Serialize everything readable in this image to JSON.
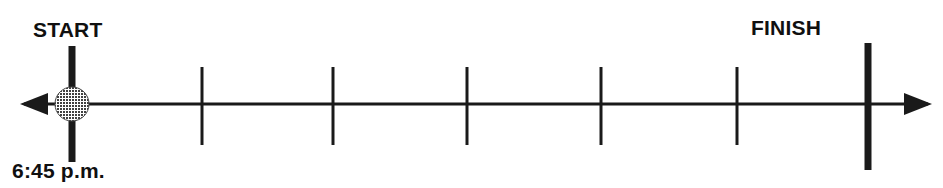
{
  "figure": {
    "type": "timeline-number-line",
    "background_color": "#ffffff",
    "line_color": "#1a1a1a",
    "marker_fill_color": "#6e6e6e",
    "width": 943,
    "height": 188
  },
  "labels": {
    "start": "START",
    "finish": "FINISH",
    "start_time": "6:45 p.m."
  },
  "axis": {
    "y": 104,
    "left_arrow_tip_x": 20,
    "right_arrow_tip_x": 932,
    "stroke_width": 3,
    "has_left_arrowhead": true,
    "has_right_arrowhead": true
  },
  "endpoints": [
    {
      "name": "start-bar",
      "x": 72,
      "y_top": 46,
      "y_bottom": 162,
      "stroke_width": 7
    },
    {
      "name": "finish-bar",
      "x": 868,
      "y_top": 43,
      "y_bottom": 170,
      "stroke_width": 7
    }
  ],
  "start_marker": {
    "name": "start-point-circle",
    "cx": 72,
    "cy": 104,
    "r": 17,
    "fill": "#6e6e6e",
    "pattern": "stippled"
  },
  "ticks": {
    "count": 5,
    "y_top": 67,
    "y_bottom": 145,
    "stroke_width": 3,
    "x_positions": [
      202,
      333,
      467,
      601,
      737
    ]
  },
  "intervals": {
    "total_segments": 6,
    "segment_spacing_px": 134
  }
}
